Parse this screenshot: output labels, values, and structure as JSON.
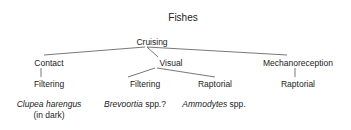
{
  "title": "Fishes",
  "root": "Cruising",
  "branches": [
    {
      "label": "Contact",
      "children": [
        {
          "label": "Filtering",
          "example": {
            "italic": "Clupea harengus",
            "suffix": "",
            "note": "(in dark)"
          }
        }
      ]
    },
    {
      "label": "Visual",
      "children": [
        {
          "label": "Filtering",
          "example": {
            "italic": "Brevoortia",
            "suffix": " spp.?",
            "note": ""
          }
        },
        {
          "label": "Raptorial",
          "example": {
            "italic": "Ammodytes",
            "suffix": " spp.",
            "note": ""
          }
        }
      ]
    },
    {
      "label": "Mechanoreception",
      "children": [
        {
          "label": "Raptorial"
        }
      ]
    }
  ],
  "colors": {
    "line": "#555555",
    "text": "#222222"
  }
}
